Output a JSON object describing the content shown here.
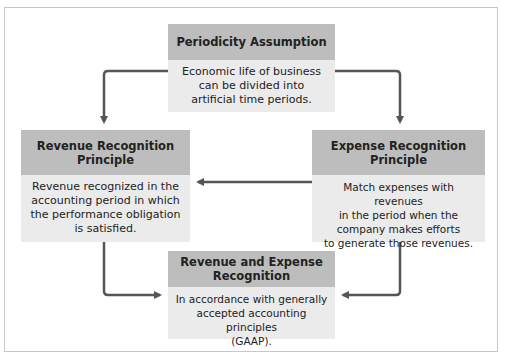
{
  "diagram": {
    "boxes": [
      {
        "id": "periodicity",
        "title": "Periodicity Assumption",
        "body": "Economic life of business\ncan be divided into\nartificial time periods."
      },
      {
        "id": "revenue",
        "title": "Revenue Recognition\nPrinciple",
        "body": "Revenue recognized in the\naccounting period in which\nthe performance obligation\nis satisfied."
      },
      {
        "id": "expense",
        "title": "Expense Recognition\nPrinciple",
        "body": "Match expenses with revenues\nin the period when the\ncompany makes efforts\nto generate those revenues."
      },
      {
        "id": "rev-exp",
        "title": "Revenue and Expense\nRecognition",
        "body": "In accordance with generally\naccepted accounting principles\n(GAAP)."
      }
    ],
    "connections": [
      {
        "from": "periodicity",
        "to": "revenue"
      },
      {
        "from": "periodicity",
        "to": "expense"
      },
      {
        "from": "expense",
        "to": "revenue"
      },
      {
        "from": "revenue",
        "to": "rev-exp"
      },
      {
        "from": "expense",
        "to": "rev-exp"
      }
    ],
    "colors": {
      "header": "#bdbdbd",
      "body": "#ebebeb",
      "arrow": "#555555",
      "border": "#c8c8c8"
    }
  }
}
